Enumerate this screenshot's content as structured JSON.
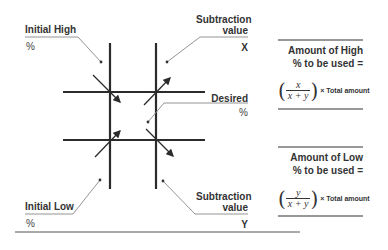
{
  "diagram": {
    "labels": {
      "initial_high": "Initial  High",
      "initial_high_unit": "%",
      "initial_low": "Initial Low",
      "initial_low_unit": "%",
      "subtraction_x_line1": "Subtraction",
      "subtraction_x_line2": "value",
      "subtraction_x_var": "X",
      "subtraction_y_line1": "Subtraction",
      "subtraction_y_line2": "value",
      "subtraction_y_var": "Y",
      "desired": "Desired",
      "desired_unit": "%"
    },
    "formulas": {
      "high": {
        "heading_line1": "Amount of High",
        "heading_line2": "% to be used =",
        "numerator": "x",
        "denominator": "x + y",
        "suffix": "× Total amount"
      },
      "low": {
        "heading_line1": "Amount of Low",
        "heading_line2": "% to be used =",
        "numerator": "y",
        "denominator": "x + y",
        "suffix": "× Total amount"
      }
    },
    "colors": {
      "lines": "#2b2b2b",
      "leader_lines": "#888888",
      "text": "#333333"
    }
  }
}
